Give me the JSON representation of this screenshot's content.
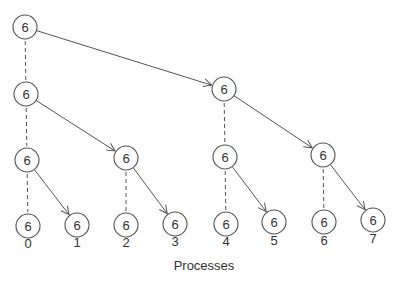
{
  "diagram": {
    "axis_label": "Processes",
    "node_value": "6",
    "nodes": [
      {
        "id": "L0-P0",
        "x": 25,
        "y": 27,
        "value": "6"
      },
      {
        "id": "L1-P0",
        "x": 26,
        "y": 94,
        "value": "6"
      },
      {
        "id": "L1-P4",
        "x": 224,
        "y": 89,
        "value": "6"
      },
      {
        "id": "L2-P0",
        "x": 27,
        "y": 160,
        "value": "6"
      },
      {
        "id": "L2-P2",
        "x": 126,
        "y": 158,
        "value": "6"
      },
      {
        "id": "L2-P4",
        "x": 225,
        "y": 157,
        "value": "6"
      },
      {
        "id": "L2-P6",
        "x": 323,
        "y": 155,
        "value": "6"
      },
      {
        "id": "L3-P0",
        "x": 28,
        "y": 226,
        "value": "6"
      },
      {
        "id": "L3-P1",
        "x": 77,
        "y": 225,
        "value": "6"
      },
      {
        "id": "L3-P2",
        "x": 126,
        "y": 225,
        "value": "6"
      },
      {
        "id": "L3-P3",
        "x": 175,
        "y": 224,
        "value": "6"
      },
      {
        "id": "L3-P4",
        "x": 226,
        "y": 224,
        "value": "6"
      },
      {
        "id": "L3-P5",
        "x": 274,
        "y": 222,
        "value": "6"
      },
      {
        "id": "L3-P6",
        "x": 324,
        "y": 222,
        "value": "6"
      },
      {
        "id": "L3-P7",
        "x": 373,
        "y": 220,
        "value": "6"
      }
    ],
    "process_labels": [
      {
        "label": "0",
        "x": 28,
        "y": 243
      },
      {
        "label": "1",
        "x": 77,
        "y": 242
      },
      {
        "label": "2",
        "x": 126,
        "y": 242
      },
      {
        "label": "3",
        "x": 175,
        "y": 241
      },
      {
        "label": "4",
        "x": 226,
        "y": 241
      },
      {
        "label": "5",
        "x": 274,
        "y": 240
      },
      {
        "label": "6",
        "x": 324,
        "y": 240
      },
      {
        "label": "7",
        "x": 373,
        "y": 238
      }
    ],
    "arrow_edges": [
      [
        "L0-P0",
        "L1-P4"
      ],
      [
        "L1-P0",
        "L2-P2"
      ],
      [
        "L1-P4",
        "L2-P6"
      ],
      [
        "L2-P0",
        "L3-P1"
      ],
      [
        "L2-P2",
        "L3-P3"
      ],
      [
        "L2-P4",
        "L3-P5"
      ],
      [
        "L2-P6",
        "L3-P7"
      ]
    ],
    "dashed_edges": [
      [
        "L0-P0",
        "L1-P0"
      ],
      [
        "L1-P0",
        "L2-P0"
      ],
      [
        "L1-P4",
        "L2-P4"
      ],
      [
        "L2-P0",
        "L3-P0"
      ],
      [
        "L2-P2",
        "L3-P2"
      ],
      [
        "L2-P4",
        "L3-P4"
      ],
      [
        "L2-P6",
        "L3-P6"
      ]
    ],
    "node_radius": 12,
    "colors": {
      "stroke": "#555555",
      "text": "#333333",
      "background": "#ffffff"
    }
  }
}
